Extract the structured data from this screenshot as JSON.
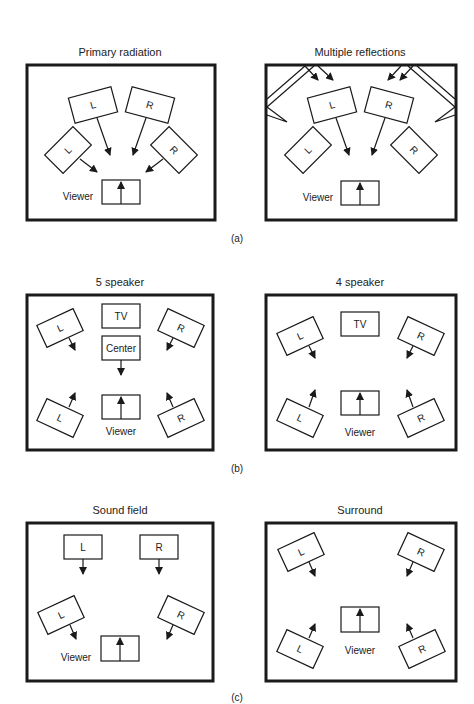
{
  "figure": {
    "groups": [
      {
        "caption": "(a)",
        "panels": [
          {
            "title": "Primary radiation",
            "speakers": [
              "L",
              "R",
              "L",
              "R"
            ],
            "viewer_label": "Viewer"
          },
          {
            "title": "Multiple reflections",
            "speakers": [
              "L",
              "R",
              "L",
              "R"
            ],
            "viewer_label": "Viewer"
          }
        ]
      },
      {
        "caption": "(b)",
        "panels": [
          {
            "title": "5 speaker",
            "tv_label": "TV",
            "center_label": "Center",
            "speakers": [
              "L",
              "R",
              "L",
              "R"
            ],
            "viewer_label": "Viewer"
          },
          {
            "title": "4 speaker",
            "tv_label": "TV",
            "speakers": [
              "L",
              "R",
              "L",
              "R"
            ],
            "viewer_label": "Viewer"
          }
        ]
      },
      {
        "caption": "(c)",
        "panels": [
          {
            "title": "Sound field",
            "speakers": [
              "L",
              "R",
              "L",
              "R"
            ],
            "viewer_label": "Viewer"
          },
          {
            "title": "Surround",
            "speakers": [
              "L",
              "R",
              "L",
              "R"
            ],
            "viewer_label": "Viewer"
          }
        ]
      }
    ]
  },
  "colors": {
    "line": "#1a1a1a",
    "background": "#ffffff"
  }
}
